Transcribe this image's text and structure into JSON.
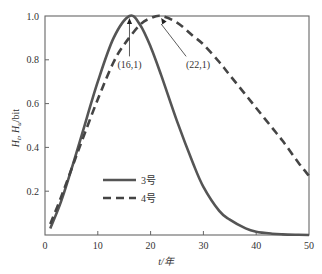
{
  "chart_data": {
    "type": "line",
    "title": "",
    "xlabel": "t/年",
    "ylabel_parts": [
      "H",
      "t",
      ", ",
      "H",
      "u",
      "/bit"
    ],
    "xlim": [
      0,
      50
    ],
    "ylim": [
      0,
      1.0
    ],
    "xticks": [
      0,
      10,
      20,
      30,
      40,
      50
    ],
    "xtick_labels": [
      "0",
      "10",
      "20",
      "30",
      "40",
      "50"
    ],
    "yticks": [
      0.2,
      0.4,
      0.6,
      0.8,
      1.0
    ],
    "ytick_labels": [
      "0.2",
      "0.4",
      "0.6",
      "0.8",
      "1.0"
    ],
    "grid": false,
    "legend_position": "lower-left-center",
    "series": [
      {
        "name": "3号",
        "style": "solid",
        "color": "#555555",
        "x": [
          1,
          3,
          5,
          7,
          10,
          13,
          16,
          18,
          20,
          22,
          25,
          28,
          30,
          33,
          35,
          38,
          40,
          43,
          45,
          48,
          50
        ],
        "y": [
          0.03,
          0.15,
          0.3,
          0.46,
          0.7,
          0.9,
          1.0,
          0.96,
          0.86,
          0.73,
          0.52,
          0.33,
          0.22,
          0.11,
          0.07,
          0.03,
          0.015,
          0.006,
          0.003,
          0.001,
          0.0
        ]
      },
      {
        "name": "4号",
        "style": "dashed",
        "color": "#444444",
        "x": [
          1,
          3,
          5,
          7,
          10,
          13,
          15,
          18,
          20,
          22,
          25,
          28,
          30,
          33,
          35,
          38,
          40,
          43,
          45,
          48,
          50
        ],
        "y": [
          0.05,
          0.17,
          0.3,
          0.43,
          0.62,
          0.79,
          0.87,
          0.96,
          0.99,
          1.0,
          0.97,
          0.91,
          0.87,
          0.79,
          0.73,
          0.64,
          0.58,
          0.49,
          0.43,
          0.33,
          0.27
        ]
      }
    ],
    "annotations": [
      {
        "text": "(16,1)",
        "point": [
          16,
          1.0
        ],
        "label_at": [
          16,
          0.77
        ]
      },
      {
        "text": "(22,1)",
        "point": [
          22,
          1.0
        ],
        "label_at": [
          29,
          0.77
        ]
      }
    ]
  }
}
